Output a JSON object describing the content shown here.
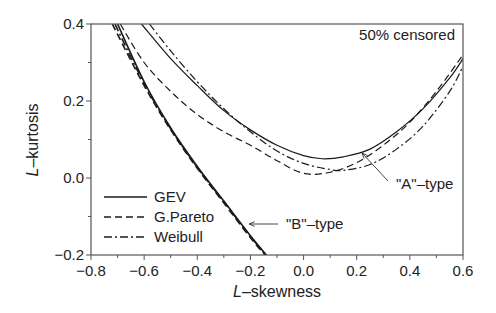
{
  "chart_data": {
    "type": "line",
    "title": "",
    "annotation": "50% censored",
    "xlabel": "L–skewness",
    "ylabel": "L–kurtosis",
    "xlabel_italic": "L",
    "xlabel_rest": "–skewness",
    "ylabel_italic": "L",
    "ylabel_rest": "–kurtosis",
    "xlim": [
      -0.8,
      0.6
    ],
    "ylim": [
      -0.2,
      0.4
    ],
    "xticks": [
      "−0.8",
      "−0.6",
      "−0.4",
      "−0.2",
      "0.0",
      "0.2",
      "0.4",
      "0.6"
    ],
    "xtick_values": [
      -0.8,
      -0.6,
      -0.4,
      -0.2,
      0.0,
      0.2,
      0.4,
      0.6
    ],
    "yticks": [
      "−0.2",
      "0.0",
      "0.2",
      "0.4"
    ],
    "ytick_values": [
      -0.2,
      0.0,
      0.2,
      0.4
    ],
    "grid": false,
    "legend_position": "lower-left",
    "legend": [
      {
        "name": "GEV",
        "style": "solid"
      },
      {
        "name": "G.Pareto",
        "style": "dashed"
      },
      {
        "name": "Weibull",
        "style": "dashdot"
      }
    ],
    "labels": [
      {
        "text": "\"A\"–type",
        "x": 0.3,
        "y": -0.03,
        "arrow_to": [
          0.22,
          0.065
        ]
      },
      {
        "text": "\"B\"–type",
        "x": -0.06,
        "y": -0.12,
        "arrow_to": [
          -0.22,
          -0.115
        ]
      }
    ],
    "series": [
      {
        "name": "GEV",
        "group": "A",
        "style": "solid",
        "x": [
          -0.61,
          -0.5,
          -0.4,
          -0.3,
          -0.2,
          -0.1,
          0.0,
          0.07,
          0.15,
          0.25,
          0.35,
          0.45,
          0.55,
          0.6
        ],
        "y": [
          0.4,
          0.31,
          0.24,
          0.175,
          0.125,
          0.085,
          0.058,
          0.05,
          0.055,
          0.075,
          0.12,
          0.18,
          0.26,
          0.31
        ]
      },
      {
        "name": "Weibull",
        "group": "A",
        "style": "dashdot",
        "x": [
          -0.58,
          -0.5,
          -0.4,
          -0.3,
          -0.2,
          -0.1,
          0.0,
          0.1,
          0.15,
          0.25,
          0.35,
          0.45,
          0.55,
          0.6
        ],
        "y": [
          0.4,
          0.33,
          0.25,
          0.18,
          0.12,
          0.07,
          0.038,
          0.022,
          0.02,
          0.035,
          0.075,
          0.135,
          0.225,
          0.29
        ]
      },
      {
        "name": "G.Pareto",
        "group": "A",
        "style": "dashed",
        "x": [
          -0.69,
          -0.6,
          -0.5,
          -0.4,
          -0.3,
          -0.2,
          -0.1,
          0.0,
          0.1,
          0.2,
          0.3,
          0.4,
          0.5,
          0.6
        ],
        "y": [
          0.4,
          0.3,
          0.225,
          0.165,
          0.12,
          0.085,
          0.045,
          0.012,
          0.015,
          0.04,
          0.085,
          0.145,
          0.225,
          0.32
        ]
      },
      {
        "name": "GEV",
        "group": "B",
        "style": "solid",
        "x": [
          -0.7,
          -0.6,
          -0.5,
          -0.4,
          -0.3,
          -0.2,
          -0.14
        ],
        "y": [
          0.4,
          0.25,
          0.13,
          0.03,
          -0.06,
          -0.15,
          -0.2
        ]
      },
      {
        "name": "G.Pareto",
        "group": "B",
        "style": "dashed",
        "x": [
          -0.72,
          -0.6,
          -0.5,
          -0.4,
          -0.3,
          -0.2,
          -0.145
        ],
        "y": [
          0.4,
          0.24,
          0.125,
          0.025,
          -0.065,
          -0.155,
          -0.2
        ]
      },
      {
        "name": "Weibull",
        "group": "B",
        "style": "dashdot",
        "x": [
          -0.71,
          -0.6,
          -0.5,
          -0.4,
          -0.3,
          -0.2,
          -0.142
        ],
        "y": [
          0.4,
          0.245,
          0.128,
          0.028,
          -0.062,
          -0.152,
          -0.2
        ]
      }
    ]
  }
}
